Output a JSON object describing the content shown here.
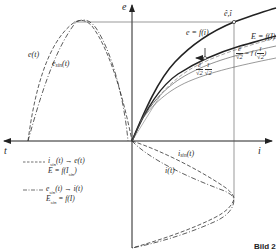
{
  "figure": {
    "caption": "Bild 2",
    "axes": {
      "vertical_label": "e",
      "horizontal_right_label": "i",
      "horizontal_left_label": "t"
    },
    "curve_labels": {
      "e_t": "e(t)",
      "e_sin_t_main": "e",
      "e_sin_t_sub": "sin",
      "e_sin_t_tail": "(t)",
      "peak_point": "ê,î",
      "e_f_i": "e = f(i)",
      "E_f_I": "E = f(I)",
      "rms_sin_lhs_num": "ê",
      "rms_sin_lhs_den": "√2",
      "rms_sin_mid": " = f (",
      "rms_sin_rhs_num": "î",
      "rms_sin_rhs_den": "√2",
      "rms_sin_end": ")",
      "small_frac1_num": "ê",
      "small_frac1_den": "√2",
      "small_frac2_num": "î",
      "small_frac2_den": "√2",
      "i_sin_main": "i",
      "i_sin_sub": "sin",
      "i_sin_tail": "(t)",
      "i_t": "i(t)"
    },
    "legend": [
      {
        "style": "dashed",
        "line1_a": "i",
        "line1_sub": "sin",
        "line1_b": "(t) → e(t)",
        "line2_a": "E = f(I",
        "line2_sub": "sin",
        "line2_b": ")"
      },
      {
        "style": "dash-dot",
        "line1_a": "e",
        "line1_sub": "sin",
        "line1_b": "(t) → i(t)",
        "line2_a": "E",
        "line2_sub": "sin",
        "line2_b": " = f(I)"
      }
    ],
    "colors": {
      "ink": "#2a2a2a",
      "background": "#ffffff"
    }
  }
}
